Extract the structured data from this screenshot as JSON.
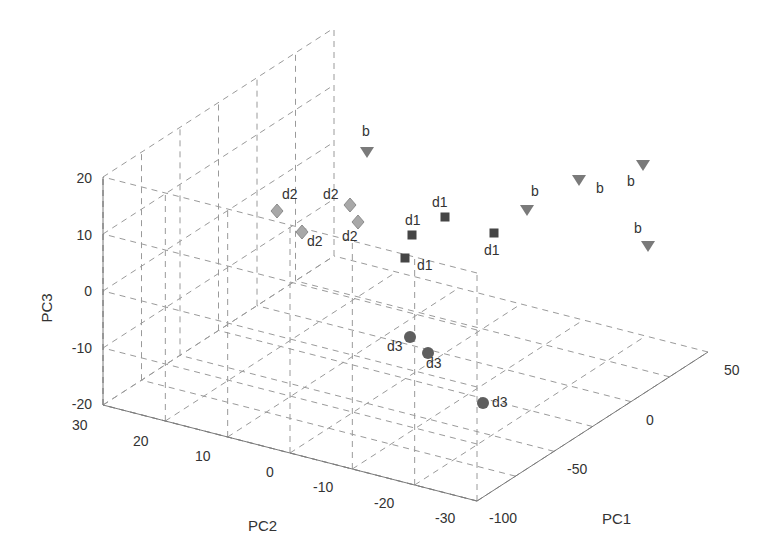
{
  "chart_data": {
    "type": "scatter3d",
    "title": "",
    "axes": {
      "x": {
        "label": "PC1",
        "range": [
          -100,
          50
        ],
        "ticks": [
          -100,
          -50,
          0,
          50
        ]
      },
      "y": {
        "label": "PC2",
        "range": [
          -30,
          30
        ],
        "ticks": [
          30,
          20,
          10,
          0,
          -10,
          -20,
          -30
        ]
      },
      "z": {
        "label": "PC3",
        "range": [
          -20,
          20
        ],
        "ticks": [
          20,
          10,
          0,
          -10,
          -20
        ]
      }
    },
    "grid": true,
    "legend": null,
    "series": [
      {
        "name": "b",
        "marker": "triangle-down",
        "color": "#7a7a7a",
        "points": [
          {
            "pc1": -55,
            "pc2": 30,
            "pc3": 10,
            "label": "b"
          },
          {
            "pc1": 10,
            "pc2": 5,
            "pc3": 10,
            "label": "b"
          },
          {
            "pc1": 25,
            "pc2": 15,
            "pc3": 18,
            "label": "b"
          },
          {
            "pc1": 45,
            "pc2": 20,
            "pc3": 20,
            "label": "b"
          },
          {
            "pc1": 45,
            "pc2": 10,
            "pc3": 6,
            "label": "b"
          }
        ]
      },
      {
        "name": "d2",
        "marker": "diamond",
        "color": "#a6a6a6",
        "points": [
          {
            "pc1": -100,
            "pc2": 20,
            "pc3": 10,
            "label": "d2"
          },
          {
            "pc1": -100,
            "pc2": 15,
            "pc3": 8,
            "label": "d2"
          },
          {
            "pc1": -70,
            "pc2": 25,
            "pc3": 7,
            "label": "d2"
          },
          {
            "pc1": -70,
            "pc2": 22,
            "pc3": 5,
            "label": "d2"
          }
        ]
      },
      {
        "name": "d1",
        "marker": "square",
        "color": "#4a4a4a",
        "points": [
          {
            "pc1": -40,
            "pc2": 15,
            "pc3": 5,
            "label": "d1"
          },
          {
            "pc1": -55,
            "pc2": 10,
            "pc3": 3,
            "label": "d1"
          },
          {
            "pc1": -60,
            "pc2": 10,
            "pc3": -1,
            "label": "d1"
          },
          {
            "pc1": -20,
            "pc2": 5,
            "pc3": 2,
            "label": "d1"
          }
        ]
      },
      {
        "name": "d3",
        "marker": "circle",
        "color": "#616161",
        "points": [
          {
            "pc1": -70,
            "pc2": 0,
            "pc3": -15,
            "label": "d3"
          },
          {
            "pc1": -65,
            "pc2": -2,
            "pc3": -17,
            "label": "d3"
          },
          {
            "pc1": -60,
            "pc2": -15,
            "pc3": -18,
            "label": "d3"
          }
        ]
      }
    ]
  },
  "render": {
    "b": [
      {
        "x": 367,
        "y": 152,
        "lx": 362,
        "ly": 136
      },
      {
        "x": 527,
        "y": 210,
        "lx": 531,
        "ly": 196
      },
      {
        "x": 579,
        "y": 180,
        "lx": 596,
        "ly": 193
      },
      {
        "x": 643,
        "y": 165,
        "lx": 627,
        "ly": 186
      },
      {
        "x": 648,
        "y": 246,
        "lx": 634,
        "ly": 233
      }
    ],
    "d2": [
      {
        "x": 277,
        "y": 211,
        "lx": 282,
        "ly": 199
      },
      {
        "x": 302,
        "y": 232,
        "lx": 307,
        "ly": 246
      },
      {
        "x": 350,
        "y": 205,
        "lx": 323,
        "ly": 199
      },
      {
        "x": 358,
        "y": 222,
        "lx": 342,
        "ly": 241
      }
    ],
    "d1": [
      {
        "x": 445,
        "y": 217,
        "lx": 432,
        "ly": 207
      },
      {
        "x": 412,
        "y": 235,
        "lx": 405,
        "ly": 225
      },
      {
        "x": 405,
        "y": 258,
        "lx": 417,
        "ly": 270
      },
      {
        "x": 494,
        "y": 233,
        "lx": 484,
        "ly": 255
      }
    ],
    "d3": [
      {
        "x": 410,
        "y": 337,
        "lx": 387,
        "ly": 351
      },
      {
        "x": 428,
        "y": 353,
        "lx": 426,
        "ly": 368
      },
      {
        "x": 483,
        "y": 403,
        "lx": 492,
        "ly": 407
      }
    ],
    "labels": {
      "pc1": "PC1",
      "pc2": "PC2",
      "pc3": "PC3",
      "z_ticks": [
        {
          "t": "20",
          "y": 183
        },
        {
          "t": "10",
          "y": 240
        },
        {
          "t": "0",
          "y": 296
        },
        {
          "t": "-10",
          "y": 353
        },
        {
          "t": "-20",
          "y": 409
        }
      ],
      "y_ticks": [
        {
          "t": "30",
          "x": 72,
          "y": 430
        },
        {
          "t": "20",
          "x": 133,
          "y": 446
        },
        {
          "t": "10",
          "x": 195,
          "y": 461
        },
        {
          "t": "0",
          "x": 266,
          "y": 477
        },
        {
          "t": "-10",
          "x": 313,
          "y": 492
        },
        {
          "t": "-20",
          "x": 374,
          "y": 508
        },
        {
          "t": "-30",
          "x": 435,
          "y": 523
        }
      ],
      "x_ticks": [
        {
          "t": "-100",
          "x": 489,
          "y": 523
        },
        {
          "t": "-50",
          "x": 567,
          "y": 474
        },
        {
          "t": "0",
          "x": 646,
          "y": 425
        },
        {
          "t": "50",
          "x": 724,
          "y": 375
        }
      ]
    }
  }
}
